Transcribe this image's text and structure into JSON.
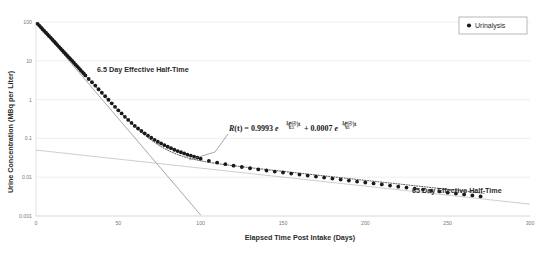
{
  "chart_data": {
    "type": "scatter",
    "title": "",
    "xlabel": "Elapsed Time Post Intake (Days)",
    "ylabel": "Urine Concentration (MBq per Liter)",
    "yscale": "log",
    "xlim": [
      0,
      300
    ],
    "ylim": [
      0.001,
      100
    ],
    "xticks": [
      0,
      50,
      100,
      150,
      200,
      250,
      300
    ],
    "xtick_labels": [
      "0",
      "50",
      "100",
      "150",
      "200",
      "250",
      "300"
    ],
    "yticks": [
      0.001,
      0.01,
      0.1,
      1,
      10,
      100
    ],
    "ytick_labels": [
      "0.001",
      "0.01",
      "0.1",
      "1",
      "10",
      "100"
    ],
    "grid": "horizontal",
    "legend_position": "top-right",
    "series": [
      {
        "name": "Urinalysis",
        "marker": "filled-circle",
        "color": "#1a1a1a",
        "x": [
          1,
          2,
          3,
          4,
          5,
          6,
          7,
          8,
          9,
          10,
          11,
          12,
          13,
          14,
          15,
          16,
          17,
          18,
          19,
          20,
          21,
          22,
          23,
          24,
          25,
          26,
          27,
          28,
          29,
          30,
          32,
          34,
          36,
          38,
          40,
          42,
          44,
          46,
          48,
          50,
          52,
          54,
          56,
          58,
          60,
          62,
          64,
          66,
          68,
          70,
          72,
          74,
          76,
          78,
          80,
          82,
          84,
          86,
          88,
          90,
          92,
          94,
          96,
          98,
          100,
          105,
          110,
          115,
          120,
          125,
          130,
          135,
          140,
          145,
          150,
          155,
          160,
          165,
          170,
          175,
          180,
          185,
          190,
          195,
          200,
          205,
          210,
          215,
          220,
          225,
          230,
          235,
          240,
          245,
          250,
          255,
          260,
          265,
          270
        ],
        "y": [
          90.0,
          81.0,
          73.0,
          65.0,
          59.0,
          53.0,
          48.0,
          43.0,
          39.0,
          35.0,
          31.5,
          28.3,
          25.5,
          22.9,
          20.6,
          18.6,
          16.7,
          15.0,
          13.5,
          12.2,
          11.0,
          9.9,
          8.9,
          8.0,
          7.2,
          6.5,
          5.8,
          5.2,
          4.7,
          4.2,
          3.4,
          2.8,
          2.3,
          1.85,
          1.5,
          1.22,
          0.99,
          0.8,
          0.65,
          0.53,
          0.44,
          0.36,
          0.3,
          0.25,
          0.21,
          0.18,
          0.155,
          0.135,
          0.118,
          0.104,
          0.092,
          0.082,
          0.074,
          0.067,
          0.061,
          0.056,
          0.051,
          0.047,
          0.044,
          0.041,
          0.038,
          0.036,
          0.034,
          0.032,
          0.03,
          0.0265,
          0.0238,
          0.0216,
          0.0198,
          0.0183,
          0.017,
          0.0159,
          0.0149,
          0.014,
          0.0132,
          0.0124,
          0.0117,
          0.011,
          0.0104,
          0.0098,
          0.0092,
          0.0087,
          0.0082,
          0.0077,
          0.0073,
          0.0069,
          0.0065,
          0.0061,
          0.0057,
          0.0054,
          0.0051,
          0.0048,
          0.0045,
          0.0043,
          0.004,
          0.0038,
          0.0036,
          0.0034,
          0.0032
        ]
      }
    ],
    "fit_curve": {
      "name": "biexponential-fit",
      "style": "dotted",
      "color": "#1a1a1a",
      "equation_terms": {
        "coefficient_fast": 0.9993,
        "half_time_fast": 6.5,
        "coefficient_slow": 0.0007,
        "half_time_slow": 65,
        "initial_value": 100
      }
    },
    "component_lines": [
      {
        "name": "fast-component-line",
        "half_time": 6.5,
        "color": "#808080",
        "from": [
          0,
          100
        ],
        "to": [
          100,
          0.00106
        ]
      },
      {
        "name": "slow-component-line",
        "half_time": 65,
        "color": "#b0b0b0",
        "from": [
          0,
          0.05
        ],
        "to": [
          300,
          0.00202
        ]
      }
    ],
    "annotations": [
      {
        "name": "fast-half-time-label",
        "text": "6.5 Day Effective Half-Time",
        "x_px": 97,
        "y_px": 70
      },
      {
        "name": "slow-half-time-label",
        "text": "65 Day Effective Half-Time",
        "x_px": 412,
        "y_px": 191
      },
      {
        "name": "equation-label",
        "text": "R(t) = 0.9993 e^(-(Ln(2)/6.5)t) + 0.0007 e^(-(Ln(2)/65)t)",
        "parts": {
          "lhs": "R",
          "lhs_arg": "(t) = ",
          "coef1": "0.9993",
          "e1": "e",
          "exp1_open": "−(",
          "exp1_num": "Ln(2)",
          "exp1_den": "6.5",
          "exp1_close": ")t",
          "plus": "+ ",
          "coef2": "0.0007",
          "e2": "e",
          "exp2_open": "−(",
          "exp2_num": "Ln(2)",
          "exp2_den": "65",
          "exp2_close": ")t"
        }
      }
    ],
    "legend": [
      {
        "name": "Urinalysis",
        "marker": "filled-circle",
        "color": "#1a1a1a"
      }
    ]
  },
  "legend": {
    "urinalysis_label": "Urinalysis"
  },
  "axes": {
    "y_title": "Urine Concentration (MBq per Liter)",
    "x_title": "Elapsed Time Post Intake (Days)",
    "y_ticks": [
      "100",
      "10",
      "1",
      "0.1",
      "0.01",
      "0.001"
    ],
    "x_ticks": [
      "0",
      "50",
      "100",
      "150",
      "200",
      "250",
      "300"
    ]
  },
  "annotations": {
    "fast": "6.5 Day Effective Half-Time",
    "slow": "65 Day Effective Half-Time"
  },
  "equation": {
    "lhs": "R",
    "lhs_arg": "(t) = ",
    "coef1": "0.9993",
    "e_sym": "e",
    "exp_open": "−(",
    "ln2": "Ln(2)",
    "den1": "6.5",
    "exp_close": ")t",
    "plus": "+ ",
    "coef2": "0.0007",
    "den2": "65"
  }
}
